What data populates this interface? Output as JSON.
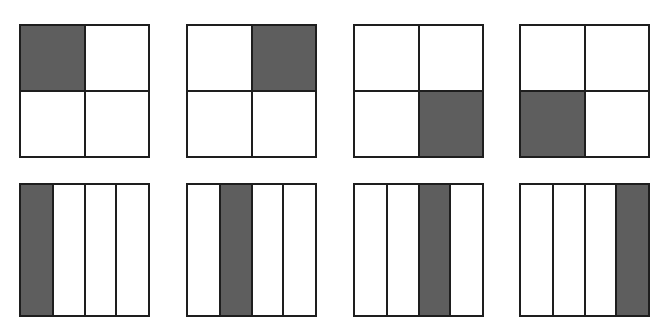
{
  "diagram": {
    "colors": {
      "stroke": "#1e1e1e",
      "filled": "#5e5e5e",
      "empty": "#ffffff"
    },
    "rows": [
      {
        "type": "quadrants",
        "shapes": [
          {
            "filled_index": 0,
            "filled_label": "top-left"
          },
          {
            "filled_index": 1,
            "filled_label": "top-right"
          },
          {
            "filled_index": 3,
            "filled_label": "bottom-right"
          },
          {
            "filled_index": 2,
            "filled_label": "bottom-left"
          }
        ]
      },
      {
        "type": "vertical-strips",
        "shapes": [
          {
            "filled_index": 0,
            "filled_label": "strip-1"
          },
          {
            "filled_index": 1,
            "filled_label": "strip-2"
          },
          {
            "filled_index": 2,
            "filled_label": "strip-3"
          },
          {
            "filled_index": 3,
            "filled_label": "strip-4"
          }
        ]
      }
    ]
  }
}
